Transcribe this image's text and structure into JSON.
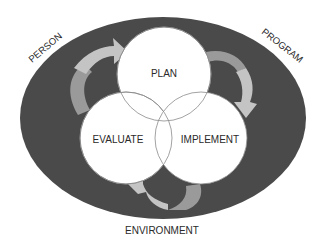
{
  "diagram": {
    "outer_ring_labels": {
      "person": "PERSON",
      "program": "PROGRAM",
      "environment": "ENVIRONMENT"
    },
    "cycle_stages": {
      "plan": "PLAN",
      "implement": "IMPLEMENT",
      "evaluate": "EVALUATE"
    },
    "colors": {
      "ellipse_fill": "#4a4a4a",
      "circle_fill": "#ffffff",
      "circle_stroke": "#8a8a8a",
      "arrow_light": "#c4c4c4",
      "arrow_mid": "#9a9a9a",
      "text": "#2a2a2a"
    }
  }
}
